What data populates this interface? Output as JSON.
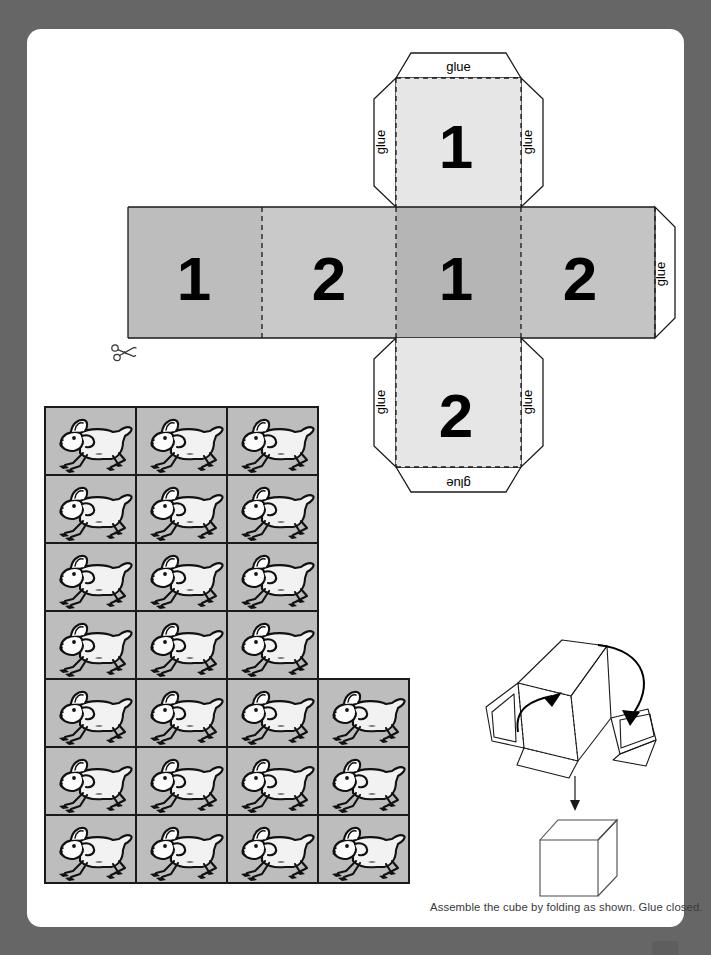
{
  "page": {
    "background_color": "#666666",
    "sheet_color": "#ffffff"
  },
  "cube_net": {
    "title": "cube-net-dice-template",
    "top_panel": {
      "digit": "1",
      "fill": "#e6e6e6"
    },
    "bottom_panel": {
      "digit": "2",
      "fill": "#e6e6e6"
    },
    "strip_panels": [
      {
        "digit": "1",
        "fill": "#bdbdbd"
      },
      {
        "digit": "2",
        "fill": "#c9c9c9"
      },
      {
        "digit": "1",
        "fill": "#b5b5b5"
      },
      {
        "digit": "2",
        "fill": "#c4c4c4"
      }
    ],
    "glue_tabs": [
      {
        "label": "glue",
        "position": "top-panel-top"
      },
      {
        "label": "glue",
        "position": "top-panel-left"
      },
      {
        "label": "glue",
        "position": "top-panel-right"
      },
      {
        "label": "glue",
        "position": "bottom-panel-left"
      },
      {
        "label": "glue",
        "position": "bottom-panel-right"
      },
      {
        "label": "glue",
        "position": "bottom-panel-bottom"
      },
      {
        "label": "glue",
        "position": "strip-right"
      }
    ],
    "fold_line_style": "dashed",
    "cut_line_style": "solid"
  },
  "sheep_grid": {
    "tile_background": "#bdbdbd",
    "tile_border": "#1a1a1a",
    "icon_name": "running-sheep",
    "rows": [
      {
        "columns": 3
      },
      {
        "columns": 3
      },
      {
        "columns": 3
      },
      {
        "columns": 3
      },
      {
        "columns": 4
      },
      {
        "columns": 4
      },
      {
        "columns": 4
      }
    ],
    "total_tiles": 24
  },
  "fold_diagram": {
    "name": "folding-instruction-diagram",
    "steps": [
      "fold-flaps-up",
      "fold-arrows",
      "down-arrow",
      "finished-cube"
    ]
  },
  "caption": {
    "text": "Assemble the cube by folding as shown. Glue closed."
  },
  "scissors": {
    "icon_name": "scissors-icon",
    "meaning": "cut along this line"
  }
}
